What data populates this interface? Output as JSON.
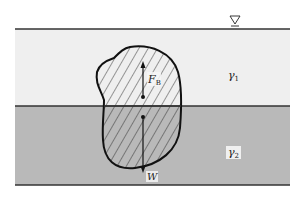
{
  "diagram": {
    "type": "buoyancy-two-fluid-layers",
    "free_surface_symbol": "∇",
    "upper_fluid": {
      "label": "γ",
      "subscript": "1",
      "color": "#efefef"
    },
    "lower_fluid": {
      "label": "γ",
      "subscript": "2",
      "color": "#b9b9b9"
    },
    "body": {
      "hatched": true,
      "outline_color": "#111111"
    },
    "forces": [
      {
        "name": "buoyancy",
        "label": "F",
        "subscript": "B",
        "direction": "up"
      },
      {
        "name": "weight",
        "label": "W",
        "subscript": "",
        "direction": "down"
      }
    ],
    "line_color": "#333333"
  }
}
